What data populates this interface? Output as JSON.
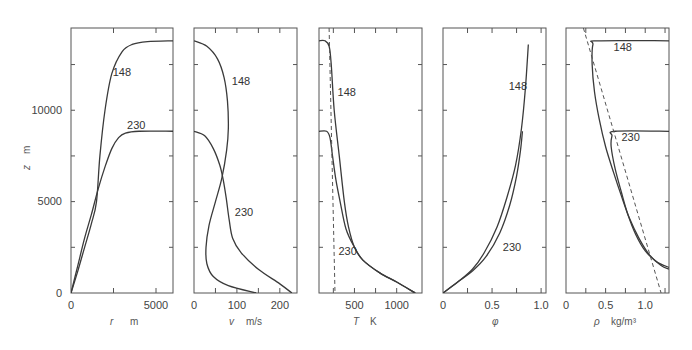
{
  "chart_data": [
    {
      "type": "line",
      "panel": "r",
      "xlabel": "r   m",
      "ylabel": "z   m",
      "xlim": [
        0,
        6000
      ],
      "ylim": [
        0,
        14500
      ],
      "xticks": [
        0,
        5000
      ],
      "xminor": [
        2500
      ],
      "yticks": [
        0,
        5000,
        10000
      ],
      "yminor": [
        2500,
        7500,
        12500
      ],
      "grid": false,
      "series": [
        {
          "name": "148",
          "x": [
            0,
            400,
            800,
            1200,
            1500,
            1700,
            2000,
            2400,
            3000,
            3600,
            4500,
            6000
          ],
          "y": [
            0,
            1200,
            2500,
            3800,
            5000,
            7500,
            10000,
            12000,
            13200,
            13600,
            13750,
            13800
          ]
        },
        {
          "name": "230",
          "x": [
            0,
            400,
            800,
            1200,
            1600,
            2000,
            2400,
            2800,
            3200,
            4000,
            6000
          ],
          "y": [
            0,
            1500,
            3000,
            4300,
            5700,
            6900,
            7900,
            8500,
            8750,
            8850,
            8850
          ]
        }
      ],
      "annotations": [
        {
          "text": "148",
          "x": 2450,
          "y": 11900
        },
        {
          "text": "230",
          "x": 3300,
          "y": 9000
        }
      ]
    },
    {
      "type": "line",
      "panel": "v",
      "xlabel": "v   m/s",
      "xlim": [
        0,
        240
      ],
      "ylim": [
        0,
        14500
      ],
      "xticks": [
        0,
        100,
        200
      ],
      "xminor": [
        50,
        150
      ],
      "yminor": [
        2500,
        5000,
        7500,
        10000,
        12500
      ],
      "series": [
        {
          "name": "148",
          "x": [
            0,
            30,
            55,
            70,
            78,
            80,
            76,
            65,
            50,
            35,
            28,
            30,
            45,
            80,
            145
          ],
          "y": [
            13800,
            13500,
            12800,
            11800,
            10500,
            9000,
            7800,
            6300,
            5000,
            3700,
            2500,
            1600,
            900,
            400,
            0
          ]
        },
        {
          "name": "230",
          "x": [
            0,
            25,
            45,
            60,
            68,
            75,
            82,
            90,
            110,
            150,
            200,
            228
          ],
          "y": [
            8850,
            8600,
            7900,
            7000,
            6200,
            5200,
            4000,
            3000,
            2200,
            1300,
            500,
            0
          ]
        }
      ],
      "annotations": [
        {
          "text": "148",
          "x": 88,
          "y": 11400
        },
        {
          "text": "230",
          "x": 95,
          "y": 4200
        }
      ]
    },
    {
      "type": "line",
      "panel": "T",
      "xlabel": "T   K",
      "xlim": [
        80,
        1300
      ],
      "ylim": [
        0,
        14500
      ],
      "xticks": [
        500,
        1000
      ],
      "xminor": [
        250,
        750
      ],
      "yminor": [
        2500,
        5000,
        7500,
        10000,
        12500
      ],
      "series": [
        {
          "name": "148",
          "x": [
            80,
            150,
            200,
            225,
            260,
            320,
            380,
            430,
            500,
            600,
            800,
            1000,
            1220
          ],
          "y": [
            13800,
            13800,
            13500,
            12500,
            10000,
            7500,
            5000,
            3600,
            2500,
            1800,
            1100,
            600,
            0
          ]
        },
        {
          "name": "230",
          "x": [
            80,
            170,
            210,
            240,
            280,
            330,
            400,
            500,
            600,
            800,
            1000,
            1220
          ],
          "y": [
            8850,
            8850,
            8500,
            7500,
            6200,
            5000,
            3500,
            2500,
            1800,
            1100,
            600,
            0
          ]
        },
        {
          "name": "reference",
          "style": "dashed",
          "x": [
            200,
            270
          ],
          "y": [
            14500,
            0
          ]
        }
      ],
      "annotations": [
        {
          "text": "148",
          "x": 300,
          "y": 10800
        },
        {
          "text": "230",
          "x": 310,
          "y": 2100
        }
      ]
    },
    {
      "type": "line",
      "panel": "phi",
      "xlabel": "φ",
      "xlim": [
        0,
        1.05
      ],
      "ylim": [
        0,
        14500
      ],
      "xticks": [
        0,
        0.5,
        1.0
      ],
      "xminor": [
        0.25,
        0.75
      ],
      "yminor": [
        2500,
        5000,
        7500,
        10000,
        12500
      ],
      "series": [
        {
          "name": "148",
          "x": [
            0,
            0.15,
            0.3,
            0.42,
            0.55,
            0.65,
            0.74,
            0.8,
            0.84,
            0.87
          ],
          "y": [
            0,
            600,
            1300,
            2200,
            3600,
            5200,
            7000,
            9000,
            11200,
            13600
          ]
        },
        {
          "name": "230",
          "x": [
            0,
            0.15,
            0.3,
            0.44,
            0.58,
            0.68,
            0.75,
            0.79,
            0.81
          ],
          "y": [
            0,
            600,
            1200,
            2000,
            3300,
            4800,
            6400,
            7800,
            8850
          ]
        }
      ],
      "annotations": [
        {
          "text": "148",
          "x": 0.67,
          "y": 11100
        },
        {
          "text": "230",
          "x": 0.61,
          "y": 2300
        }
      ]
    },
    {
      "type": "line",
      "panel": "rho",
      "xlabel": "ρ   kg/m³",
      "xlim": [
        0,
        1.3
      ],
      "ylim": [
        0,
        14500
      ],
      "xticks": [
        0,
        0.5,
        1.0
      ],
      "xminor": [
        0.25,
        0.75,
        1.25
      ],
      "yminor": [
        2500,
        5000,
        7500,
        10000,
        12500
      ],
      "series": [
        {
          "name": "148",
          "x": [
            1.3,
            0.4,
            0.34,
            0.33,
            0.36,
            0.42,
            0.5,
            0.6,
            0.7,
            0.8,
            0.92,
            1.05,
            1.2,
            1.3
          ],
          "y": [
            13800,
            13800,
            13600,
            12500,
            11000,
            9500,
            8000,
            6600,
            5300,
            4100,
            3000,
            2100,
            1500,
            1300
          ]
        },
        {
          "name": "230",
          "x": [
            1.3,
            0.62,
            0.58,
            0.57,
            0.62,
            0.7,
            0.78,
            0.88,
            1.0,
            1.15,
            1.3
          ],
          "y": [
            8850,
            8850,
            8600,
            8000,
            6800,
            5500,
            4300,
            3200,
            2300,
            1700,
            1400
          ]
        },
        {
          "name": "reference",
          "style": "dashed",
          "x": [
            0.22,
            1.2
          ],
          "y": [
            14500,
            0
          ]
        }
      ],
      "annotations": [
        {
          "text": "148",
          "x": 0.6,
          "y": 13250
        },
        {
          "text": "230",
          "x": 0.7,
          "y": 8300
        }
      ]
    }
  ],
  "axes": {
    "y_tick_labels": [
      "0",
      "5000",
      "10000"
    ],
    "y_label_symbol": "z",
    "y_label_unit": "m",
    "panels": [
      {
        "symbol": "r",
        "unit": "m",
        "tick_labels": [
          "0",
          "5000"
        ]
      },
      {
        "symbol": "v",
        "unit": "m/s",
        "tick_labels": [
          "0",
          "100",
          "200"
        ]
      },
      {
        "symbol": "T",
        "unit": "K",
        "tick_labels": [
          "500",
          "1000"
        ]
      },
      {
        "symbol": "φ",
        "unit": "",
        "tick_labels": [
          "0",
          "0.5",
          "1.0"
        ]
      },
      {
        "symbol": "ρ",
        "unit": "kg/m³",
        "tick_labels": [
          "0",
          "0.5",
          "1.0"
        ]
      }
    ]
  }
}
